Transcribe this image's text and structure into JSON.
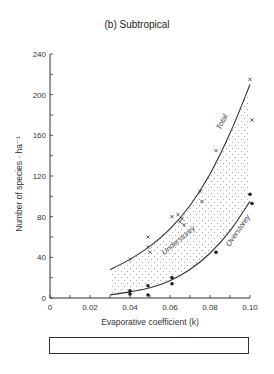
{
  "title": "(b) Subtropical",
  "chart_data": {
    "type": "scatter",
    "title": "(b) Subtropical",
    "xlabel": "Evaporative coefficient (k)",
    "ylabel": "Number of species · ha⁻¹",
    "xlim": [
      0,
      0.1
    ],
    "ylim": [
      0,
      240
    ],
    "x_ticks": [
      "0",
      "0.02",
      "0.04",
      "0.06",
      "0.08",
      "0.10"
    ],
    "y_ticks": [
      "0",
      "40",
      "80",
      "120",
      "160",
      "200",
      "240"
    ],
    "grid": false,
    "series": [
      {
        "name": "Total",
        "marker": "x",
        "points": [
          [
            0.04,
            38
          ],
          [
            0.049,
            60
          ],
          [
            0.049,
            50
          ],
          [
            0.05,
            45
          ],
          [
            0.061,
            80
          ],
          [
            0.064,
            82
          ],
          [
            0.065,
            75
          ],
          [
            0.066,
            78
          ],
          [
            0.067,
            72
          ],
          [
            0.075,
            105
          ],
          [
            0.076,
            95
          ],
          [
            0.083,
            145
          ],
          [
            0.1,
            215
          ],
          [
            0.101,
            175
          ]
        ],
        "fit_curve": [
          [
            0.03,
            28
          ],
          [
            0.04,
            38
          ],
          [
            0.05,
            51
          ],
          [
            0.06,
            68
          ],
          [
            0.07,
            91
          ],
          [
            0.08,
            122
          ],
          [
            0.09,
            162
          ],
          [
            0.1,
            210
          ]
        ]
      },
      {
        "name": "Overstorey",
        "marker": "dot",
        "points": [
          [
            0.04,
            7
          ],
          [
            0.04,
            4
          ],
          [
            0.049,
            12
          ],
          [
            0.049,
            3
          ],
          [
            0.061,
            20
          ],
          [
            0.061,
            14
          ],
          [
            0.083,
            45
          ],
          [
            0.1,
            102
          ],
          [
            0.101,
            93
          ]
        ],
        "fit_curve": [
          [
            0.03,
            3
          ],
          [
            0.04,
            6
          ],
          [
            0.05,
            10
          ],
          [
            0.06,
            17
          ],
          [
            0.07,
            28
          ],
          [
            0.08,
            44
          ],
          [
            0.09,
            66
          ],
          [
            0.1,
            95
          ]
        ]
      }
    ],
    "annotations": [
      {
        "text": "Total",
        "x": 0.087,
        "y": 172,
        "rotation": -62
      },
      {
        "text": "Understorey",
        "x": 0.065,
        "y": 55,
        "rotation": -40
      },
      {
        "text": "Overstorey",
        "x": 0.095,
        "y": 65,
        "rotation": -55
      }
    ],
    "shaded_region": "Understorey (dotted area between Total and Overstorey curves)"
  },
  "climate_zones": [
    {
      "label": "ARID",
      "from": 0,
      "to": 0.035
    },
    {
      "label": "SEMI-ARID",
      "from": 0.035,
      "to": 0.04
    },
    {
      "label": "SUB-HUMID",
      "from": 0.04,
      "to": 0.05
    },
    {
      "label": "HUMID",
      "from": 0.05,
      "to": 0.07
    },
    {
      "label": "PERHUMID",
      "from": 0.07,
      "to": 0.1
    }
  ]
}
